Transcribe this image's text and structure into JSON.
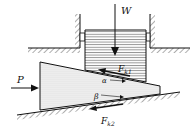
{
  "diagram": {
    "type": "wedge-friction-mechanics",
    "labels": {
      "weight": "W",
      "push_force": "P",
      "friction_top": "F",
      "friction_top_sub": "k1",
      "friction_bottom": "F",
      "friction_bottom_sub": "k2",
      "angle_top": "α",
      "angle_bottom": "β"
    },
    "colors": {
      "stroke": "#111111",
      "block_fill": "#ffffff",
      "wedge_fill": "#ececec",
      "hatch": "#333333"
    }
  }
}
